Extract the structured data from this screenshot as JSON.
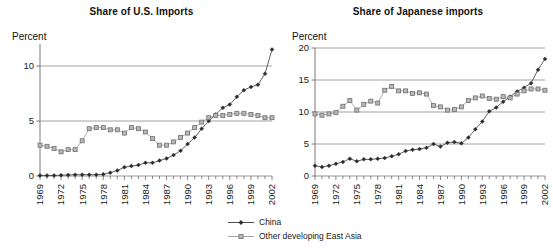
{
  "figure": {
    "legend": {
      "position": "bottom-center",
      "items": [
        {
          "label": "China",
          "marker": "diamond",
          "color": "#3a3a3a"
        },
        {
          "label": "Other developing East Asia",
          "marker": "square",
          "color": "#8c8c8c"
        }
      ]
    }
  },
  "colors": {
    "china_line": "#3a3a3a",
    "china_marker": "#2b2b2b",
    "other_line": "#9a9a9a",
    "other_marker_fill": "#b8b8b8",
    "other_marker_stroke": "#6f6f6f",
    "gridline": "#8a8a8a",
    "axis": "#6b6b6b",
    "text": "#1a1a1a"
  },
  "chart_data": [
    {
      "type": "line",
      "id": "share-of-us-imports",
      "title": "Share of U.S. Imports",
      "xlabel": "",
      "ylabel": "Percent",
      "ylim": [
        0,
        12
      ],
      "yticks": [
        0,
        5,
        10
      ],
      "grid": true,
      "xlim": [
        1969,
        2002
      ],
      "x": [
        1969,
        1970,
        1971,
        1972,
        1973,
        1974,
        1975,
        1976,
        1977,
        1978,
        1979,
        1980,
        1981,
        1982,
        1983,
        1984,
        1985,
        1986,
        1987,
        1988,
        1989,
        1990,
        1991,
        1992,
        1993,
        1994,
        1995,
        1996,
        1997,
        1998,
        1999,
        2000,
        2001,
        2002
      ],
      "xticks": [
        1969,
        1972,
        1975,
        1978,
        1981,
        1984,
        1987,
        1990,
        1993,
        1996,
        1999,
        2002
      ],
      "xticklabels": [
        "1969",
        "1972",
        "1975",
        "1978",
        "1981",
        "1984",
        "1987",
        "1990",
        "1993",
        "1996",
        "1999",
        "2002"
      ],
      "series": [
        {
          "name": "China",
          "marker": "diamond",
          "values": [
            0.05,
            0.05,
            0.05,
            0.07,
            0.1,
            0.12,
            0.12,
            0.12,
            0.12,
            0.15,
            0.3,
            0.5,
            0.8,
            0.9,
            1.0,
            1.2,
            1.2,
            1.4,
            1.6,
            1.9,
            2.3,
            2.9,
            3.5,
            4.3,
            5.0,
            5.6,
            6.2,
            6.5,
            7.2,
            7.8,
            8.1,
            8.3,
            9.3,
            11.5
          ]
        },
        {
          "name": "Other developing East Asia",
          "marker": "square",
          "values": [
            2.8,
            2.7,
            2.5,
            2.2,
            2.4,
            2.4,
            3.2,
            4.3,
            4.4,
            4.4,
            4.2,
            4.2,
            3.9,
            4.4,
            4.3,
            4.0,
            3.4,
            2.8,
            2.8,
            3.1,
            3.5,
            3.9,
            4.4,
            4.9,
            5.3,
            5.5,
            5.5,
            5.6,
            5.7,
            5.7,
            5.6,
            5.5,
            5.3,
            5.3
          ]
        }
      ]
    },
    {
      "type": "line",
      "id": "share-of-japanese-imports",
      "title": "Share of Japanese imports",
      "xlabel": "",
      "ylabel": "Percent",
      "ylim": [
        0,
        20
      ],
      "yticks": [
        0,
        5,
        10,
        15,
        20
      ],
      "grid": true,
      "xlim": [
        1969,
        2002
      ],
      "x": [
        1969,
        1970,
        1971,
        1972,
        1973,
        1974,
        1975,
        1976,
        1977,
        1978,
        1979,
        1980,
        1981,
        1982,
        1983,
        1984,
        1985,
        1986,
        1987,
        1988,
        1989,
        1990,
        1991,
        1992,
        1993,
        1994,
        1995,
        1996,
        1997,
        1998,
        1999,
        2000,
        2001,
        2002
      ],
      "xticks": [
        1969,
        1972,
        1975,
        1978,
        1981,
        1984,
        1987,
        1990,
        1993,
        1996,
        1999,
        2002
      ],
      "xticklabels": [
        "1969",
        "1972",
        "1975",
        "1978",
        "1981",
        "1984",
        "1987",
        "1990",
        "1993",
        "1996",
        "1999",
        "2002"
      ],
      "series": [
        {
          "name": "China",
          "marker": "diamond",
          "values": [
            1.6,
            1.4,
            1.6,
            1.9,
            2.2,
            2.7,
            2.3,
            2.6,
            2.6,
            2.7,
            2.8,
            3.1,
            3.4,
            3.9,
            4.1,
            4.2,
            4.4,
            5.0,
            4.6,
            5.2,
            5.3,
            5.1,
            6.0,
            7.3,
            8.5,
            10.1,
            10.7,
            11.6,
            12.4,
            13.2,
            13.8,
            14.5,
            16.6,
            18.3
          ]
        },
        {
          "name": "Other developing East Asia",
          "marker": "square",
          "values": [
            9.7,
            9.5,
            9.7,
            9.9,
            10.9,
            11.8,
            10.3,
            11.2,
            11.7,
            11.4,
            13.4,
            14.0,
            13.3,
            13.3,
            12.9,
            13.0,
            12.8,
            11.0,
            10.8,
            10.3,
            10.4,
            10.8,
            11.8,
            12.2,
            12.5,
            12.1,
            12.0,
            12.4,
            12.2,
            12.8,
            13.3,
            13.6,
            13.6,
            13.4
          ]
        }
      ]
    }
  ]
}
